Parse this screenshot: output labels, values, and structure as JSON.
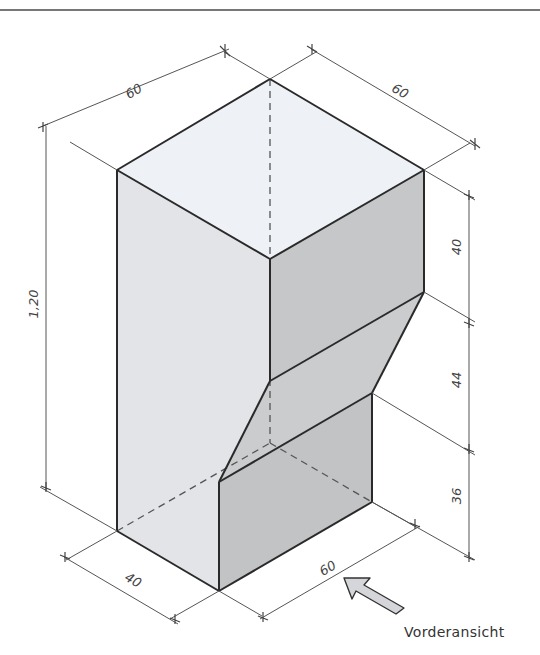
{
  "figure": {
    "type": "isometric technical drawing",
    "object": "stepped rectangular prism with inclined transition face",
    "caption": "Vorderansicht",
    "view_arrow": "front-view-direction-arrow"
  },
  "dimensions": {
    "top_left_width": "60",
    "top_right_depth": "60",
    "total_height": "1,20",
    "upper_section_height": "40",
    "transition_height": "44",
    "lower_section_height": "36",
    "bottom_left_width": "40",
    "bottom_right_depth": "60"
  },
  "colors": {
    "outline": "#2a2a2a",
    "dimension_line": "#555555",
    "face_light": "#e6e8ec",
    "face_top": "#eef1f5",
    "face_mid": "#c8c9cb",
    "face_dark": "#bdbebf",
    "arrow_fill": "#d4d6d9"
  }
}
